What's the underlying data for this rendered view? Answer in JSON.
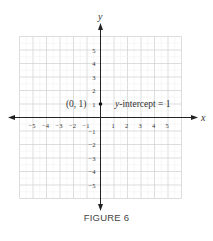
{
  "figure": {
    "caption": "FIGURE 6"
  },
  "chart_data": {
    "type": "scatter",
    "title": "",
    "xlabel": "x",
    "ylabel": "y",
    "xlim": [
      -6,
      6
    ],
    "ylim": [
      -6,
      6
    ],
    "grid": true,
    "x_ticks": [
      -5,
      -4,
      -3,
      -2,
      -1,
      1,
      2,
      3,
      4,
      5
    ],
    "y_ticks": [
      -5,
      -4,
      -3,
      -2,
      -1,
      1,
      2,
      3,
      4,
      5
    ],
    "x_tick_labels": [
      "−5",
      "−4",
      "−3",
      "−2",
      "−1",
      "1",
      "2",
      "3",
      "4",
      "5"
    ],
    "y_tick_labels": [
      "−5",
      "−4",
      "−3",
      "−2",
      "−1",
      "1",
      "2",
      "3",
      "4",
      "5"
    ],
    "points": [
      {
        "x": 0,
        "y": 1,
        "label": "(0, 1)"
      }
    ],
    "annotations": [
      {
        "text": "y-intercept = 1",
        "italic_part": "y",
        "rest": "-intercept = 1",
        "x": 1,
        "y": 1
      }
    ],
    "colors": {
      "axis": "#222222",
      "grid": "#d4d4d4",
      "grid_minor": "#eeeeee",
      "point": "#111111",
      "text": "#333333"
    }
  }
}
